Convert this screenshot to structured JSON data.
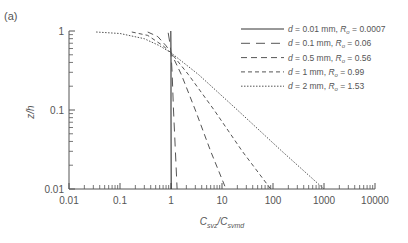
{
  "chart_data": {
    "type": "line",
    "panel_label": "(a)",
    "xlabel": "C_svz/C_svmd",
    "xlabel_main": "C",
    "xlabel_sub1": "svz",
    "xlabel_sep": "/C",
    "xlabel_sub2": "svmd",
    "ylabel": "z/h",
    "xscale": "log",
    "yscale": "log",
    "xlim": [
      0.01,
      10000
    ],
    "ylim": [
      0.01,
      1
    ],
    "x_ticks": [
      "0.01",
      "0.1",
      "1",
      "10",
      "100",
      "1000",
      "10000"
    ],
    "y_ticks": [
      "1",
      "0.1",
      "0.01"
    ],
    "grid": false,
    "legend_position": "upper right",
    "series": [
      {
        "name": "d = 0.01 mm, Ro = 0.0007",
        "d_label": "d",
        "d_text": " = 0.01 mm, ",
        "r_label": "R",
        "r_sub": "o",
        "r_text": " = 0.0007",
        "style": "solid",
        "x": [
          0.99,
          1.0,
          1.0,
          1.01
        ],
        "y": [
          1.0,
          0.5,
          0.1,
          0.01
        ]
      },
      {
        "name": "d = 0.1 mm, Ro = 0.06",
        "d_label": "d",
        "d_text": " = 0.1 mm, ",
        "r_label": "R",
        "r_sub": "o",
        "r_text": " = 0.06",
        "style": "longdash",
        "x": [
          0.88,
          0.95,
          1.0,
          1.05,
          1.12,
          1.22,
          1.32
        ],
        "y": [
          0.95,
          0.7,
          0.53,
          0.3,
          0.1,
          0.03,
          0.01
        ]
      },
      {
        "name": "d = 0.5 mm, Ro = 0.56",
        "d_label": "d",
        "d_text": " = 0.5 mm, ",
        "r_label": "R",
        "r_sub": "o",
        "r_text": " = 0.56",
        "style": "dash",
        "x": [
          0.35,
          0.55,
          0.8,
          1.0,
          1.6,
          3.0,
          6.0,
          12.0
        ],
        "y": [
          0.97,
          0.85,
          0.65,
          0.53,
          0.28,
          0.1,
          0.03,
          0.01
        ]
      },
      {
        "name": "d = 1 mm, Ro = 0.99",
        "d_label": "d",
        "d_text": " = 1 mm, ",
        "r_label": "R",
        "r_sub": "o",
        "r_text": " = 0.99",
        "style": "shortdash",
        "x": [
          0.17,
          0.35,
          0.7,
          1.0,
          2.2,
          7.0,
          25.0,
          90.0
        ],
        "y": [
          0.97,
          0.88,
          0.65,
          0.53,
          0.28,
          0.1,
          0.03,
          0.01
        ]
      },
      {
        "name": "d = 2 mm, Ro = 1.53",
        "d_label": "d",
        "d_text": " = 2 mm, ",
        "r_label": "R",
        "r_sub": "o",
        "r_text": " = 1.53",
        "style": "dotted",
        "x": [
          0.034,
          0.1,
          0.3,
          0.6,
          1.0,
          3.5,
          20.0,
          150.0,
          1000.0
        ],
        "y": [
          0.97,
          0.93,
          0.8,
          0.65,
          0.53,
          0.28,
          0.1,
          0.03,
          0.01
        ]
      }
    ]
  }
}
